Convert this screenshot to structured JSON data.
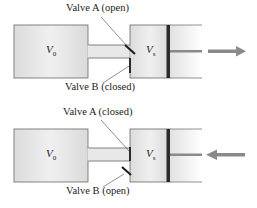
{
  "diagram": {
    "panels": [
      {
        "id": "top",
        "tank_label": "V",
        "tank_sub": "0",
        "cylinder_label": "V",
        "cylinder_sub": "s",
        "valve_a_label": "Valve A (open)",
        "valve_b_label": "Valve B (closed)",
        "valve_a_state": "open",
        "valve_b_state": "closed",
        "piston_motion": "outward",
        "arrow_direction": "right"
      },
      {
        "id": "bottom",
        "tank_label": "V",
        "tank_sub": "0",
        "cylinder_label": "V",
        "cylinder_sub": "s",
        "valve_a_label": "Valve A (closed)",
        "valve_b_label": "Valve B (open)",
        "valve_a_state": "closed",
        "valve_b_state": "open",
        "piston_motion": "inward",
        "arrow_direction": "left"
      }
    ],
    "colors": {
      "vessel_fill": "#e6e6e6",
      "vessel_stroke": "#555555",
      "piston": "#2b2b2b",
      "valve": "#1a1a1a",
      "arrow": "#8a8a8a",
      "leader_line": "#444444"
    }
  }
}
